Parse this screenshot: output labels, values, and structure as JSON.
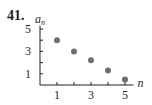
{
  "problem": {
    "number": "41."
  },
  "chart_data": {
    "type": "scatter",
    "title": "",
    "xlabel": "n",
    "ylabel": "a_n",
    "ylabel_main": "a",
    "ylabel_sub": "n",
    "x_ticks": [
      1,
      2,
      3,
      4,
      5
    ],
    "x_tick_labels": [
      "1",
      "",
      "3",
      "",
      "5"
    ],
    "y_ticks": [
      1,
      2,
      3,
      4,
      5
    ],
    "y_tick_labels": [
      "1",
      "",
      "3",
      "",
      "5"
    ],
    "xlim": [
      0,
      5.5
    ],
    "ylim": [
      0,
      5.3
    ],
    "grid": false,
    "legend": null,
    "series": [
      {
        "name": "a_n",
        "x": [
          1,
          2,
          3,
          4,
          5
        ],
        "y": [
          4,
          3,
          2.2,
          1.3,
          0.5
        ]
      }
    ],
    "colors": {
      "point": "#6d6e71",
      "axis": "#231f20"
    }
  }
}
